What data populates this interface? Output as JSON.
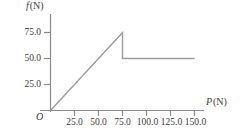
{
  "chart_data": {
    "type": "line",
    "title": "",
    "xlabel": "P (N)",
    "ylabel": "f (N)",
    "xlabel_var": "P",
    "xlabel_unit": "(N)",
    "ylabel_var": "f",
    "ylabel_unit": "(N)",
    "origin_label": "O",
    "grid": false,
    "legend": false,
    "xlim": [
      0,
      162
    ],
    "ylim": [
      0,
      88
    ],
    "xticks": [
      25.0,
      50.0,
      75.0,
      100.0,
      125.0,
      150.0
    ],
    "xtick_labels": [
      "25.0",
      "50.0",
      "75.0",
      "100.0",
      "125.0",
      "150.0"
    ],
    "yticks": [
      25.0,
      50.0,
      75.0
    ],
    "ytick_labels": [
      "25.0",
      "50.0",
      "75.0"
    ],
    "series": [
      {
        "name": "static-then-kinetic-friction",
        "points": [
          {
            "x": 0,
            "y": 0
          },
          {
            "x": 75,
            "y": 75
          },
          {
            "x": 75,
            "y": 50
          },
          {
            "x": 150,
            "y": 50
          }
        ]
      }
    ],
    "annotations": {
      "peak_x": 75.0,
      "peak_y": 75.0,
      "plateau_y": 50.0,
      "plateau_end_x": 150.0
    },
    "colors": {
      "line": "#9a9a9a",
      "axis": "#8a8a8a",
      "text": "#3b3b3b",
      "background": "#ffffff"
    }
  }
}
